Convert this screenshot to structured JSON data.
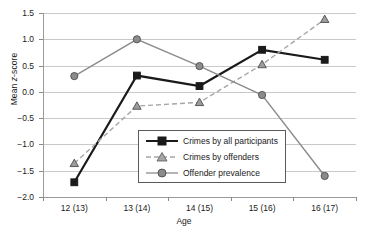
{
  "chart_data": {
    "type": "line",
    "title": "",
    "xlabel": "Age",
    "ylabel": "Mean z-score",
    "categories": [
      "12 (13)",
      "13 (14)",
      "14 (15)",
      "15 (16)",
      "16 (17)"
    ],
    "ylim": [
      -2.0,
      1.5
    ],
    "yticks": [
      "1.5",
      "1.0",
      "0.5",
      "0.0",
      "-0.5",
      "-1.0",
      "-1.5",
      "-2.0"
    ],
    "ytick_values": [
      1.5,
      1.0,
      0.5,
      0.0,
      -0.5,
      -1.0,
      -1.5,
      -2.0
    ],
    "grid": true,
    "legend_position": "center",
    "series": [
      {
        "name": "Crimes by all participants",
        "values": [
          -1.72,
          0.31,
          0.11,
          0.8,
          0.61
        ],
        "color": "#1a1a1a",
        "marker": "square",
        "linestyle": "solid"
      },
      {
        "name": "Crimes by offenders",
        "values": [
          -1.36,
          -0.27,
          -0.2,
          0.52,
          1.38
        ],
        "color": "#a6a6a6",
        "marker": "triangle",
        "linestyle": "dashed"
      },
      {
        "name": "Offender prevalence",
        "values": [
          0.3,
          1.0,
          0.49,
          -0.06,
          -1.6
        ],
        "color": "#8c8c8c",
        "marker": "circle",
        "linestyle": "solid"
      }
    ]
  },
  "axis": {
    "y_title_prefix": "Mean ",
    "y_title_italic": "z",
    "y_title_suffix": "-score"
  }
}
